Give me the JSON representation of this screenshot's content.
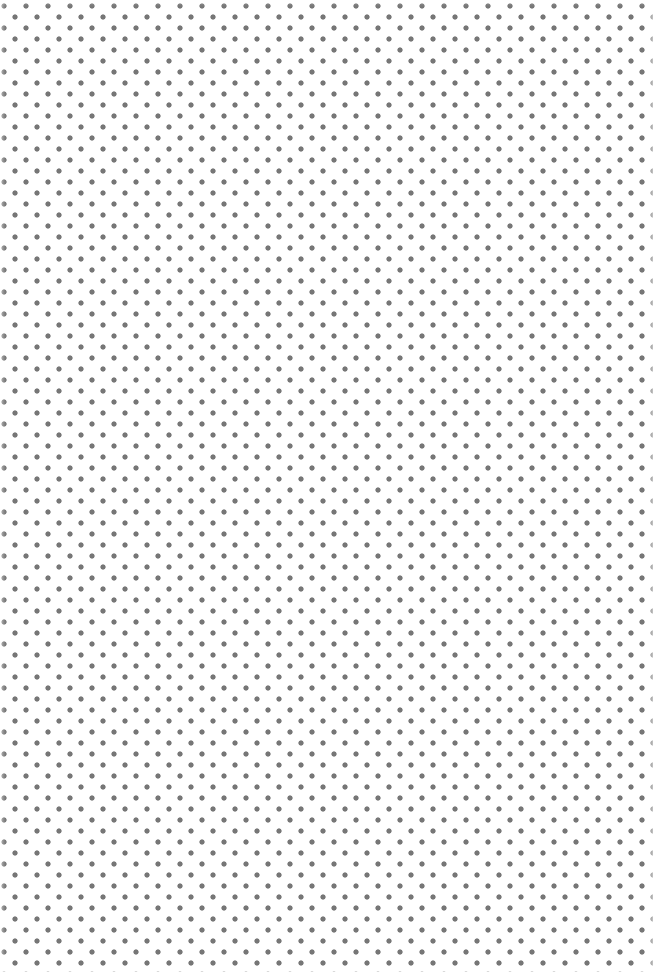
{
  "pattern": {
    "type": "dot-grid",
    "layout": "staggered",
    "dot_color": "#767676",
    "background_color": "#ffffff",
    "dot_diameter_px": 5,
    "pitch_px": 22,
    "row_offset_px": 11
  }
}
